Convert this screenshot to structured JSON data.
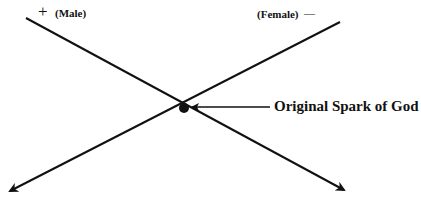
{
  "diagram": {
    "labels": {
      "male_sign": "+",
      "male": "(Male)",
      "female": "(Female)",
      "female_sign": "—",
      "center": "Original Spark of God"
    },
    "colors": {
      "line": "#111111",
      "background": "#ffffff"
    }
  }
}
